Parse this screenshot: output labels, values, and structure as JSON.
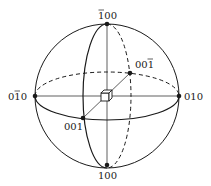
{
  "diagram": {
    "type": "stereographic-sphere",
    "colors": {
      "stroke": "#1a1a1a",
      "background": "#ffffff"
    },
    "sphere": {
      "cx": 107,
      "cy": 96,
      "r": 72
    },
    "equator_ellipse": {
      "cx": 107,
      "cy": 95,
      "rx": 72,
      "ry": 24,
      "front": "solid",
      "back": "dashed"
    },
    "meridian_ellipse": {
      "cx": 107,
      "cy": 96,
      "rx": 24,
      "ry": 72,
      "front": "solid",
      "back": "dashed"
    },
    "points": [
      {
        "id": "top",
        "label": "1̄ 0 0",
        "display": "100",
        "bar_over": 0,
        "x": 107,
        "y": 24
      },
      {
        "id": "bottom",
        "label": "100",
        "display": "100",
        "bar_over": null,
        "x": 107,
        "y": 165
      },
      {
        "id": "left",
        "label": "0 1̄ 0",
        "display": "010",
        "bar_over": 1,
        "x": 35,
        "y": 96
      },
      {
        "id": "right",
        "label": "010",
        "display": "010",
        "bar_over": null,
        "x": 180,
        "y": 96
      },
      {
        "id": "front",
        "label": "001",
        "display": "001",
        "bar_over": null,
        "x": 83,
        "y": 118
      },
      {
        "id": "back",
        "label": "0 0 1̄",
        "display": "001",
        "bar_over": 2,
        "x": 130,
        "y": 73
      }
    ],
    "labels": {
      "top": "100",
      "bottom": "100",
      "left": "010",
      "right": "010",
      "front": "001",
      "back": "001"
    },
    "center_icon": "cube-icon"
  }
}
